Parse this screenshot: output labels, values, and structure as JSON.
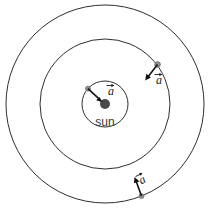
{
  "figure": {
    "type": "physics-diagram",
    "canvas": {
      "width": 211,
      "height": 210,
      "background": "#ffffff"
    },
    "center": {
      "x": 105,
      "y": 104
    },
    "colors": {
      "orbit_stroke": "#2e2e2e",
      "sun_fill": "#4a4a4a",
      "planet_fill": "#8a8a8a",
      "vector_stroke": "#111111",
      "label_text": "#3a3a3a"
    },
    "sun": {
      "label": "sun",
      "radius": 5,
      "label_offset_y": 22
    },
    "orbits": [
      {
        "name": "inner-orbit",
        "radius": 23,
        "planet_angle_deg": 138,
        "vector_label": "a",
        "vector_length": 16,
        "label_x": 111,
        "label_y": 95
      },
      {
        "name": "middle-orbit",
        "radius": 65,
        "planet_angle_deg": 33,
        "vector_label": "a",
        "vector_length": 17,
        "label_x": 159,
        "label_y": 84
      },
      {
        "name": "outer-orbit",
        "radius": 99,
        "planet_angle_deg": -69,
        "vector_label": "a",
        "vector_length": 17,
        "label_x": 144,
        "label_y": 183
      }
    ]
  }
}
